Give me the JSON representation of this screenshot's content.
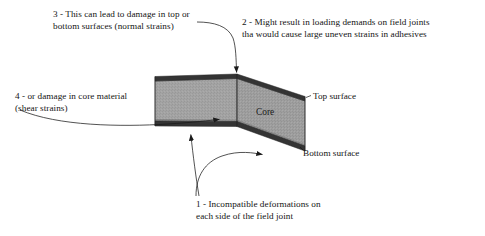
{
  "figure": {
    "background_color": "#ffffff",
    "text_color": "#141414"
  },
  "panel": {
    "core_label": "Core",
    "top_surface_label": "Top surface",
    "bottom_surface_label": "Bottom surface",
    "colors": {
      "core_fill": "#a3a3a3",
      "core_fill_right": "#9e9e9e",
      "skin_fill": "#333333",
      "outline": "#1c1c1c",
      "leader_line": "#1a1a1a"
    }
  },
  "callouts": [
    {
      "id": "callout-1",
      "number": "1",
      "lines": [
        "1 - Incompatible deformations on",
        "each side of the field joint"
      ]
    },
    {
      "id": "callout-2",
      "number": "2",
      "lines": [
        "2 - Might result in loading demands on field joints",
        "tha would cause large uneven strains in adhesives"
      ]
    },
    {
      "id": "callout-3",
      "number": "3",
      "lines": [
        "3 - This can lead to damage in top or",
        "bottom surfaces (normal strains)"
      ]
    },
    {
      "id": "callout-4",
      "number": "4",
      "lines": [
        "4 - or damage in core material",
        "(shear strains)"
      ]
    }
  ]
}
